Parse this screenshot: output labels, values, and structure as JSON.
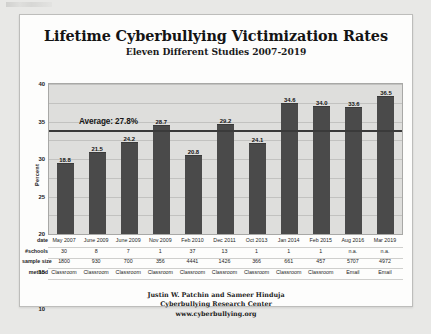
{
  "chart_data": {
    "type": "bar",
    "title": "Lifetime Cyberbullying Victimization Rates",
    "subtitle": "Eleven Different Studies 2007-2019",
    "xlabel": "",
    "ylabel": "Percent",
    "ylim": [
      0,
      40
    ],
    "yticks": [
      0,
      5,
      10,
      15,
      20,
      25,
      30,
      35,
      40
    ],
    "grid": true,
    "legend": "none",
    "categories": [
      "May 2007",
      "June 2009",
      "June 2009",
      "Nov 2009",
      "Feb 2010",
      "Dec 2011",
      "Oct 2013",
      "Jan 2014",
      "Feb 2015",
      "Aug 2016",
      "Mar 2019"
    ],
    "values": [
      18.8,
      21.5,
      24.2,
      28.7,
      20.8,
      29.2,
      24.1,
      34.6,
      34.0,
      33.6,
      36.5
    ],
    "bar_color": "#4a4a4a",
    "plot_background": "#dededc",
    "annotations": [
      {
        "name": "average-line",
        "label": "Average: 27.8%",
        "value": 27.8,
        "orientation": "horizontal",
        "color": "#3a3a3a"
      }
    ]
  },
  "table": {
    "row_labels": [
      "date",
      "#schools",
      "sample size",
      "method"
    ],
    "rows": {
      "date": [
        "May 2007",
        "June 2009",
        "June 2009",
        "Nov 2009",
        "Feb 2010",
        "Dec 2011",
        "Oct 2013",
        "Jan 2014",
        "Feb 2015",
        "Aug 2016",
        "Mar 2019"
      ],
      "schools": [
        "30",
        "8",
        "7",
        "1",
        "37",
        "13",
        "1",
        "1",
        "1",
        "n.a.",
        "n.a."
      ],
      "sample_size": [
        "1800",
        "930",
        "700",
        "356",
        "4441",
        "1426",
        "366",
        "661",
        "457",
        "5707",
        "4972"
      ],
      "method": [
        "Classroom",
        "Classroom",
        "Classroom",
        "Classroom",
        "Classroom",
        "Classroom",
        "Classroom",
        "Classroom",
        "Classroom",
        "Email",
        "Email"
      ]
    }
  },
  "footer": {
    "authors": "Justin W. Patchin and Sameer Hinduja",
    "organization": "Cyberbullying Research Center",
    "website": "www.cyberbullying.org"
  }
}
